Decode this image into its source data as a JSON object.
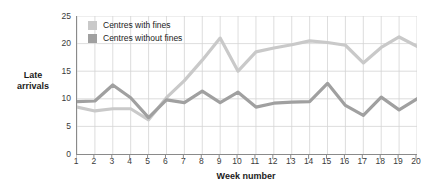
{
  "chart_data": {
    "type": "line",
    "title": "",
    "xlabel": "Week number",
    "ylabel": "Late arrivals",
    "xlim": [
      1,
      20
    ],
    "ylim": [
      0,
      25
    ],
    "grid": true,
    "legend_position": "top-left-inside",
    "x": [
      1,
      2,
      3,
      4,
      5,
      6,
      7,
      8,
      9,
      10,
      11,
      12,
      13,
      14,
      15,
      16,
      17,
      18,
      19,
      20
    ],
    "xticklabels": [
      "1",
      "2",
      "3",
      "4",
      "5",
      "6",
      "7",
      "8",
      "9",
      "10",
      "11",
      "12",
      "13",
      "14",
      "15",
      "16",
      "17",
      "18",
      "19",
      "20"
    ],
    "yticks": [
      0,
      5,
      10,
      15,
      20,
      25
    ],
    "yticklabels": [
      "0",
      "5",
      "10",
      "15",
      "20",
      "25"
    ],
    "series": [
      {
        "name": "Centres with fines",
        "color": "#c9c9c9",
        "values": [
          8.5,
          7.8,
          8.2,
          8.2,
          6.2,
          10.2,
          13.3,
          17.0,
          21.0,
          15.0,
          18.5,
          19.2,
          19.8,
          20.5,
          20.2,
          19.7,
          16.5,
          19.3,
          21.2,
          19.5
        ]
      },
      {
        "name": "Centres without fines",
        "color": "#a0a0a0",
        "values": [
          9.5,
          9.6,
          12.5,
          10.2,
          6.6,
          9.8,
          9.3,
          11.4,
          9.3,
          11.2,
          8.5,
          9.2,
          9.4,
          9.5,
          12.8,
          8.8,
          7.0,
          10.3,
          8.0,
          10.0
        ]
      }
    ]
  },
  "legend": {
    "items": [
      {
        "label": "Centres with fines",
        "color": "#c9c9c9"
      },
      {
        "label": "Centres without fines",
        "color": "#a0a0a0"
      }
    ]
  },
  "axes": {
    "y_title": "Late\narrivals",
    "y_title_line1": "Late",
    "y_title_line2": "arrivals",
    "x_title": "Week number"
  },
  "colors": {
    "axis": "#8a8a8a",
    "grid": "#d4d4d4",
    "text": "#1b1b1b",
    "tick_text": "#3a3a3a",
    "series_light": "#c9c9c9",
    "series_dark": "#a0a0a0",
    "background": "#ffffff"
  }
}
